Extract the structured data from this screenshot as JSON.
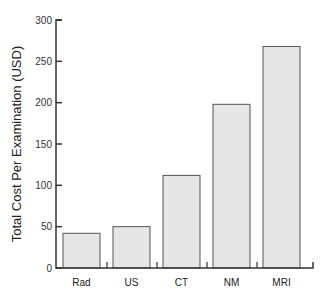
{
  "chart_data": {
    "type": "bar",
    "title": "",
    "xlabel": "",
    "ylabel": "Total Cost Per Examination (USD)",
    "categories": [
      "Rad",
      "US",
      "CT",
      "NM",
      "MRI"
    ],
    "values": [
      42,
      50,
      112,
      198,
      268
    ],
    "ylim": [
      0,
      300
    ],
    "yticks": [
      0,
      50,
      100,
      150,
      200,
      250,
      300
    ],
    "grid": false,
    "legend": null,
    "bar_color": "#e6e6e6",
    "bar_edge_color": "#555555"
  }
}
